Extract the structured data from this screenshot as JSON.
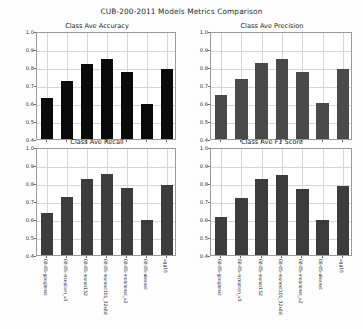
{
  "figure": {
    "suptitle": "CUB-200-2011 Models Metrics Comparison",
    "background": "#fdfdfd",
    "axes_border_color": "#9a9a9a",
    "grid_color": "#d6d6d6"
  },
  "models": [
    "08-05-googlenet",
    "08-05-inception_v3",
    "08-05-resnet152",
    "08-05-resnext101_32x8d",
    "08-05-mobilenet_v2",
    "08-05-alexnet",
    "vgg16"
  ],
  "yticks": [
    "0.4",
    "0.5",
    "0.6",
    "0.7",
    "0.8",
    "0.9",
    "1.0"
  ],
  "chart_data": [
    {
      "type": "bar",
      "title": "Class Ave Accuracy",
      "xlabel": "",
      "ylabel": "",
      "ylim": [
        0.4,
        1.0
      ],
      "grid": true,
      "bar_color": "#0a0a0a",
      "categories": [
        "08-05-googlenet",
        "08-05-inception_v3",
        "08-05-resnet152",
        "08-05-resnext101_32x8d",
        "08-05-mobilenet_v2",
        "08-05-alexnet",
        "vgg16"
      ],
      "values": [
        0.628,
        0.722,
        0.818,
        0.845,
        0.773,
        0.597,
        0.788
      ]
    },
    {
      "type": "bar",
      "title": "Class Ave Precision",
      "xlabel": "",
      "ylabel": "",
      "ylim": [
        0.4,
        1.0
      ],
      "grid": true,
      "bar_color": "#4a4a4a",
      "categories": [
        "08-05-googlenet",
        "08-05-inception_v3",
        "08-05-resnet152",
        "08-05-resnext101_32x8d",
        "08-05-mobilenet_v2",
        "08-05-alexnet",
        "vgg16"
      ],
      "values": [
        0.645,
        0.735,
        0.823,
        0.845,
        0.775,
        0.598,
        0.79
      ]
    },
    {
      "type": "bar",
      "title": "Class Ave Recall",
      "xlabel": "",
      "ylabel": "",
      "ylim": [
        0.4,
        1.0
      ],
      "grid": true,
      "bar_color": "#3c3c3c",
      "categories": [
        "08-05-googlenet",
        "08-05-inception_v3",
        "08-05-resnet152",
        "08-05-resnext101_32x8d",
        "08-05-mobilenet_v2",
        "08-05-alexnet",
        "vgg16"
      ],
      "values": [
        0.632,
        0.723,
        0.82,
        0.848,
        0.77,
        0.597,
        0.788
      ]
    },
    {
      "type": "bar",
      "title": "Class Ave F1 Score",
      "xlabel": "",
      "ylabel": "",
      "ylim": [
        0.4,
        1.0
      ],
      "grid": true,
      "bar_color": "#3c3c3c",
      "categories": [
        "08-05-googlenet",
        "08-05-inception_v3",
        "08-05-resnet152",
        "08-05-resnext101_32x8d",
        "08-05-mobilenet_v2",
        "08-05-alexnet",
        "vgg16"
      ],
      "values": [
        0.612,
        0.718,
        0.82,
        0.845,
        0.765,
        0.593,
        0.785
      ]
    }
  ]
}
